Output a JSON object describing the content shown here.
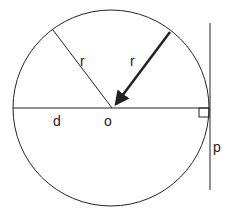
{
  "diagram": {
    "labels": {
      "radius_left": "r",
      "radius_right": "r",
      "diameter": "d",
      "center": "o",
      "tangent": "p"
    },
    "colors": {
      "stroke": "#222222",
      "background": "#ffffff"
    }
  }
}
